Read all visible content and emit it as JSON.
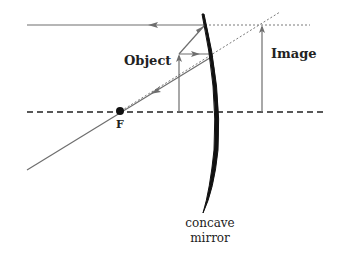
{
  "diagram": {
    "labels": {
      "object": "Object",
      "image": "Image",
      "focal_point": "F",
      "mirror_line1": "concave",
      "mirror_line2": "mirror"
    },
    "colors": {
      "ray": "#6e6e6e",
      "mirror": "#111111",
      "axis": "#222222",
      "dotted": "#7a7a7a"
    }
  }
}
